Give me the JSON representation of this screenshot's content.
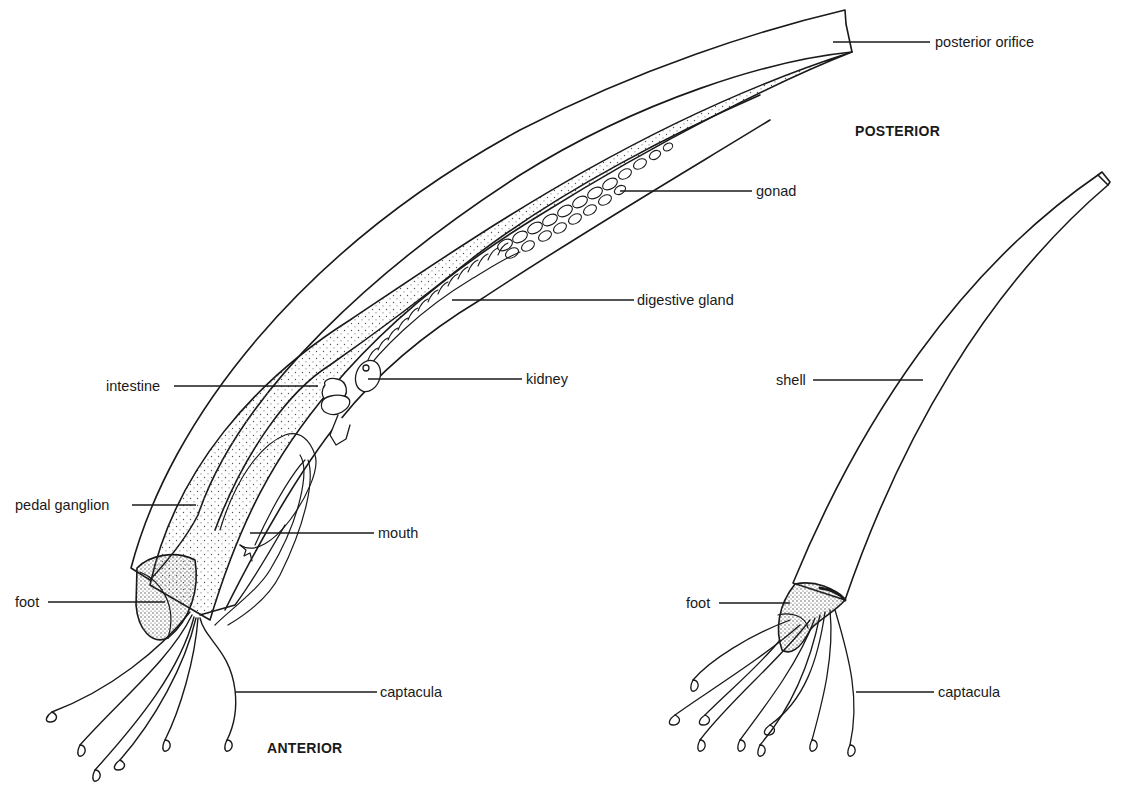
{
  "figure": {
    "orientation_labels": {
      "posterior": "POSTERIOR",
      "anterior": "ANTERIOR"
    },
    "left_figure": {
      "description": "Internal anatomy (shell cut away)",
      "labels": [
        {
          "id": "posterior_orifice",
          "text": "posterior orifice"
        },
        {
          "id": "gonad",
          "text": "gonad"
        },
        {
          "id": "digestive_gland",
          "text": "digestive gland"
        },
        {
          "id": "intestine",
          "text": "intestine"
        },
        {
          "id": "kidney",
          "text": "kidney"
        },
        {
          "id": "pedal_ganglion",
          "text": "pedal ganglion"
        },
        {
          "id": "mouth",
          "text": "mouth"
        },
        {
          "id": "foot",
          "text": "foot"
        },
        {
          "id": "captacula",
          "text": "captacula"
        }
      ]
    },
    "right_figure": {
      "description": "External view",
      "labels": [
        {
          "id": "shell",
          "text": "shell"
        },
        {
          "id": "foot",
          "text": "foot"
        },
        {
          "id": "captacula",
          "text": "captacula"
        }
      ]
    }
  },
  "colors": {
    "ink": "#1a1a1a",
    "background": "#ffffff",
    "stipple": "#555555"
  }
}
